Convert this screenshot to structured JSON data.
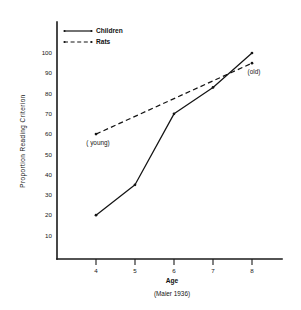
{
  "chart_data": {
    "type": "line",
    "title": "",
    "xlabel": "Age",
    "ylabel": "Proportion  Reading  Criterion",
    "source_note": "(Maier 1936)",
    "x": [
      4,
      5,
      6,
      7,
      8
    ],
    "xlim": [
      3.4,
      8.7
    ],
    "ylim": [
      0,
      108
    ],
    "xticks": [
      "4",
      "5",
      "6",
      "7",
      "8"
    ],
    "yticks": [
      "10",
      "20",
      "30",
      "40",
      "50",
      "60",
      "70",
      "80",
      "90",
      "100"
    ],
    "ytick_values": [
      10,
      20,
      30,
      40,
      50,
      60,
      70,
      80,
      90,
      100
    ],
    "grid": false,
    "legend_position": "top-left",
    "series": [
      {
        "name": "Children",
        "style": "solid",
        "color": "#141414",
        "x": [
          4,
          5,
          6,
          7,
          8
        ],
        "values": [
          20,
          35,
          70,
          83,
          100
        ]
      },
      {
        "name": "Rats",
        "style": "dashed",
        "color": "#141414",
        "x": [
          4,
          8
        ],
        "values": [
          60,
          95
        ]
      }
    ],
    "annotations": [
      {
        "text": "( young)",
        "x": 4,
        "y": 60,
        "position": "below-left"
      },
      {
        "text": "(old)",
        "x": 8,
        "y": 95,
        "position": "below-left"
      }
    ]
  },
  "legend": {
    "items": [
      {
        "label": "Children",
        "style": "solid"
      },
      {
        "label": "Rats",
        "style": "dashed"
      }
    ]
  }
}
